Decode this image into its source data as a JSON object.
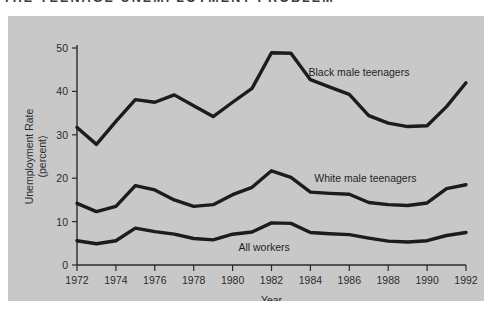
{
  "title": "THE TEENAGE UNEMPLOYMENT PROBLEM",
  "chart_data": {
    "type": "line",
    "title": "THE TEENAGE UNEMPLOYMENT PROBLEM",
    "xlabel": "Year",
    "ylabel": "Unemployment Rate (percent)",
    "ylabel_line1": "Unemployment Rate",
    "ylabel_line2": "(percent)",
    "xlim": [
      1972,
      1992
    ],
    "ylim": [
      0,
      50
    ],
    "yticks": [
      0,
      10,
      20,
      30,
      40,
      50
    ],
    "ytick_labels": [
      "0",
      "10",
      "20",
      "30",
      "40",
      "50"
    ],
    "xticks": [
      1972,
      1974,
      1976,
      1978,
      1980,
      1982,
      1984,
      1986,
      1988,
      1990,
      1992
    ],
    "xtick_labels": [
      "1972",
      "1974",
      "1976",
      "1978",
      "1980",
      "1982",
      "1984",
      "1986",
      "1988",
      "1990",
      "1992"
    ],
    "grid": false,
    "legend": "inline-labels",
    "x": [
      1972,
      1973,
      1974,
      1975,
      1976,
      1977,
      1978,
      1979,
      1980,
      1981,
      1982,
      1983,
      1984,
      1985,
      1986,
      1987,
      1988,
      1989,
      1990,
      1991,
      1992
    ],
    "series": [
      {
        "name": "Black male teenagers",
        "label": "Black male teenagers",
        "label_x": 1983.9,
        "label_y": 43.5,
        "values": [
          31.7,
          27.8,
          33.1,
          38.1,
          37.5,
          39.2,
          36.7,
          34.2,
          37.5,
          40.7,
          48.9,
          48.8,
          42.7,
          41.0,
          39.3,
          34.4,
          32.7,
          31.9,
          32.1,
          36.5,
          42.0
        ]
      },
      {
        "name": "White male teenagers",
        "label": "White male teenagers",
        "label_x": 1984.2,
        "label_y": 19.2,
        "values": [
          14.2,
          12.3,
          13.5,
          18.3,
          17.3,
          15.0,
          13.5,
          13.9,
          16.2,
          17.9,
          21.7,
          20.2,
          16.8,
          16.5,
          16.3,
          14.4,
          13.9,
          13.7,
          14.3,
          17.6,
          18.5
        ]
      },
      {
        "name": "All workers",
        "label": "All workers",
        "label_x": 1980.3,
        "label_y": 3.3,
        "values": [
          5.6,
          4.9,
          5.6,
          8.5,
          7.7,
          7.1,
          6.1,
          5.8,
          7.1,
          7.6,
          9.7,
          9.6,
          7.5,
          7.2,
          7.0,
          6.2,
          5.5,
          5.3,
          5.6,
          6.8,
          7.5
        ]
      }
    ]
  }
}
